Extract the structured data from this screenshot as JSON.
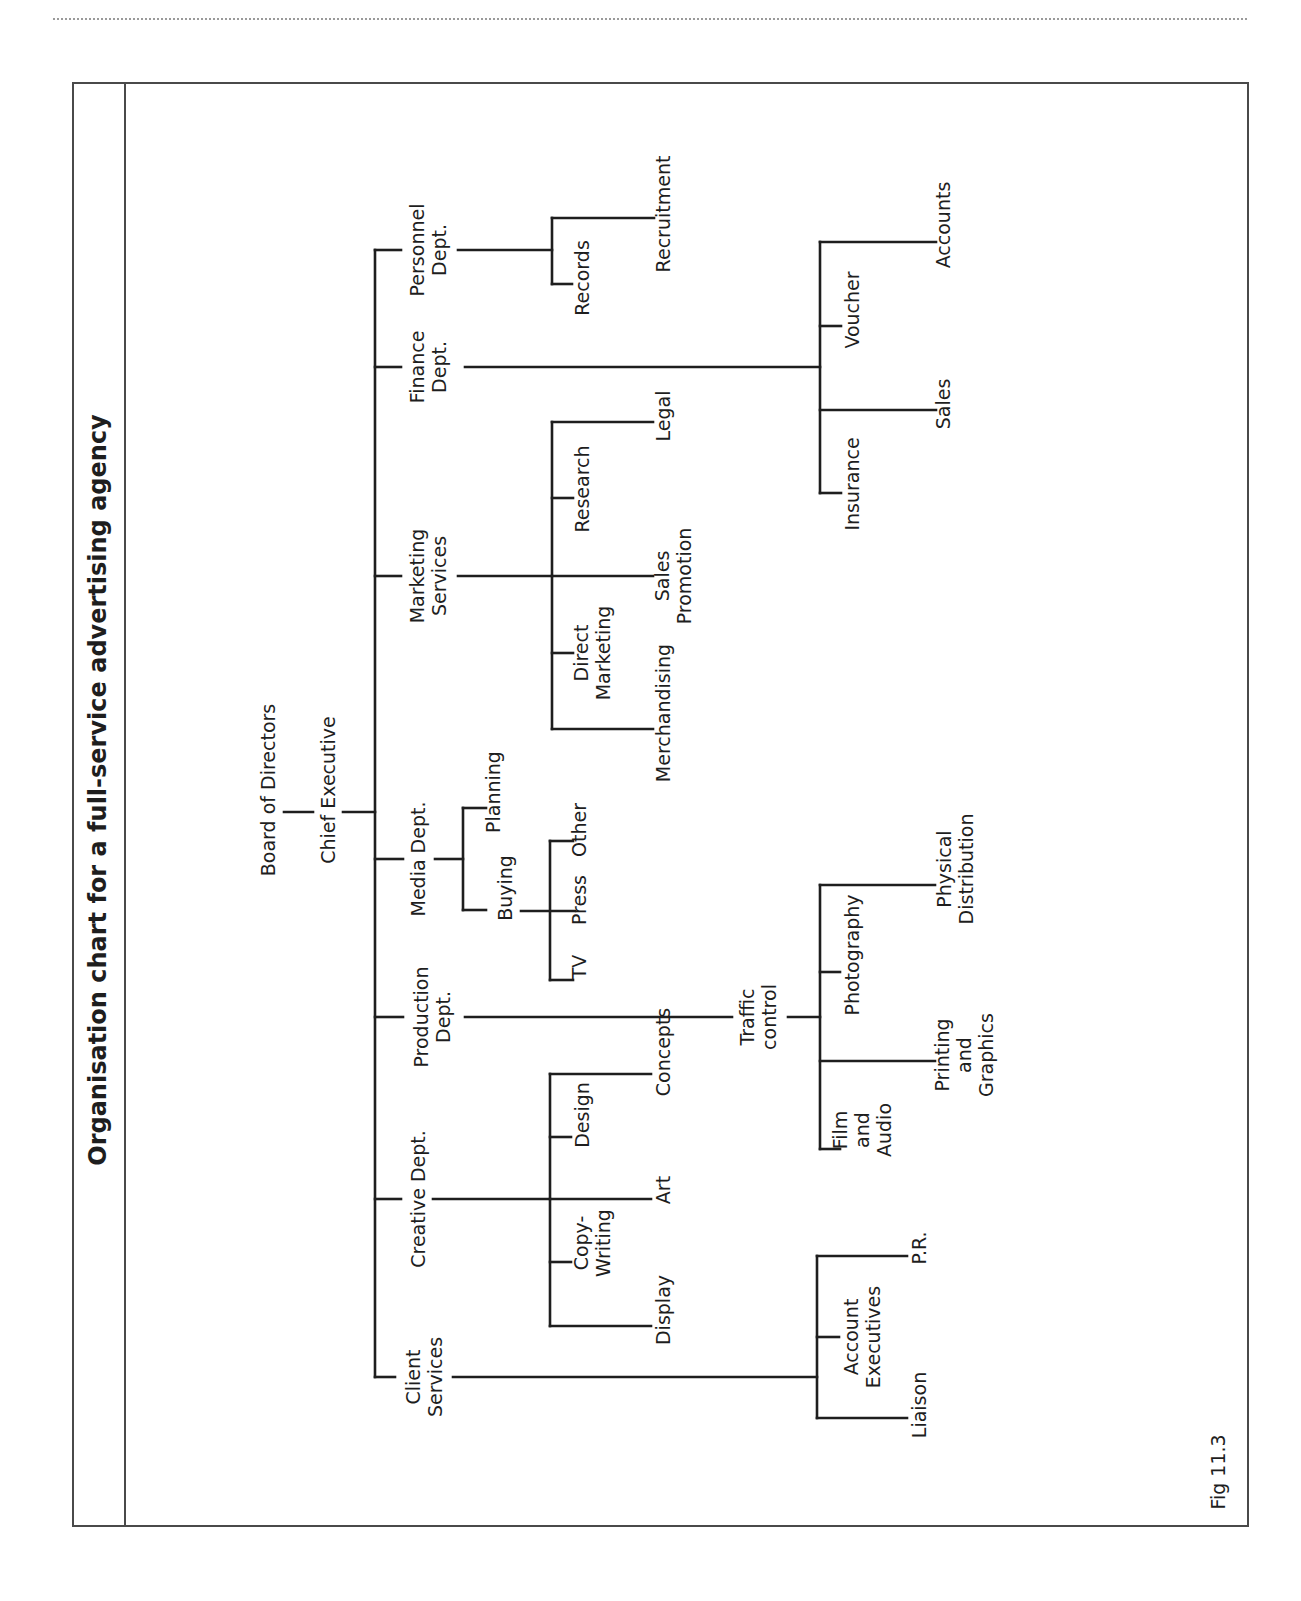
{
  "page": {
    "dotted_rule": true
  },
  "figure": {
    "title": "Organisation chart for a full-service advertising agency",
    "caption": "Fig 11.3"
  },
  "org_chart": {
    "root": "Board of Directors",
    "chief": "Chief Executive",
    "departments": [
      {
        "name": "Personnel Dept.",
        "lines": [
          "Personnel",
          "Dept."
        ],
        "children": [
          {
            "name": "Recruitment",
            "lines": [
              "Recruitment"
            ]
          },
          {
            "name": "Records",
            "lines": [
              "Records"
            ]
          }
        ]
      },
      {
        "name": "Finance Dept.",
        "lines": [
          "Finance",
          "Dept."
        ],
        "children": [
          {
            "name": "Accounts",
            "lines": [
              "Accounts"
            ]
          },
          {
            "name": "Voucher",
            "lines": [
              "Voucher"
            ]
          },
          {
            "name": "Sales",
            "lines": [
              "Sales"
            ]
          },
          {
            "name": "Insurance",
            "lines": [
              "Insurance"
            ]
          }
        ]
      },
      {
        "name": "Marketing Services",
        "lines": [
          "Marketing",
          "Services"
        ],
        "children": [
          {
            "name": "Legal",
            "lines": [
              "Legal"
            ]
          },
          {
            "name": "Research",
            "lines": [
              "Research"
            ]
          },
          {
            "name": "Sales Promotion",
            "lines": [
              "Sales",
              "Promotion"
            ]
          },
          {
            "name": "Direct Marketing",
            "lines": [
              "Direct",
              "Marketing"
            ]
          },
          {
            "name": "Merchandising",
            "lines": [
              "Merchandising"
            ]
          }
        ]
      },
      {
        "name": "Media Dept.",
        "lines": [
          "Media Dept."
        ],
        "children": [
          {
            "name": "Planning",
            "lines": [
              "Planning"
            ]
          },
          {
            "name": "Buying",
            "lines": [
              "Buying"
            ],
            "children": [
              {
                "name": "Other",
                "lines": [
                  "Other"
                ]
              },
              {
                "name": "Press",
                "lines": [
                  "Press"
                ]
              },
              {
                "name": "TV",
                "lines": [
                  "TV"
                ]
              }
            ]
          }
        ]
      },
      {
        "name": "Production Dept.",
        "lines": [
          "Production",
          "Dept."
        ],
        "children": [
          {
            "name": "Traffic control",
            "lines": [
              "Traffic",
              "control"
            ],
            "children": [
              {
                "name": "Physical Distribution",
                "lines": [
                  "Physical",
                  "Distribution"
                ]
              },
              {
                "name": "Photography",
                "lines": [
                  "Photography"
                ]
              },
              {
                "name": "Printing and Graphics",
                "lines": [
                  "Printing",
                  "and",
                  "Graphics"
                ]
              },
              {
                "name": "Film and Audio",
                "lines": [
                  "Film",
                  "and",
                  "Audio"
                ]
              }
            ]
          }
        ]
      },
      {
        "name": "Creative Dept.",
        "lines": [
          "Creative Dept."
        ],
        "children": [
          {
            "name": "Concepts",
            "lines": [
              "Concepts"
            ]
          },
          {
            "name": "Design",
            "lines": [
              "Design"
            ]
          },
          {
            "name": "Art",
            "lines": [
              "Art"
            ]
          },
          {
            "name": "Copy-Writing",
            "lines": [
              "Copy-",
              "Writing"
            ]
          },
          {
            "name": "Display",
            "lines": [
              "Display"
            ]
          }
        ]
      },
      {
        "name": "Client Services",
        "lines": [
          "Client",
          "Services"
        ],
        "children": [
          {
            "name": "P.R.",
            "lines": [
              "P.R."
            ]
          },
          {
            "name": "Account Executives",
            "lines": [
              "Account",
              "Executives"
            ]
          },
          {
            "name": "Liaison",
            "lines": [
              "Liaison"
            ]
          }
        ]
      }
    ]
  },
  "labels": {
    "board": [
      "Board of Directors"
    ],
    "chief": [
      "Chief Executive"
    ],
    "personnel": [
      "Personnel",
      "Dept."
    ],
    "recruitment": [
      "Recruitment"
    ],
    "records": [
      "Records"
    ],
    "finance": [
      "Finance",
      "Dept."
    ],
    "accounts": [
      "Accounts"
    ],
    "voucher": [
      "Voucher"
    ],
    "sales": [
      "Sales"
    ],
    "insurance": [
      "Insurance"
    ],
    "marketing": [
      "Marketing",
      "Services"
    ],
    "legal": [
      "Legal"
    ],
    "research": [
      "Research"
    ],
    "sales_promotion": [
      "Sales",
      "Promotion"
    ],
    "direct_marketing": [
      "Direct",
      "Marketing"
    ],
    "merchandising": [
      "Merchandising"
    ],
    "media": [
      "Media Dept."
    ],
    "planning": [
      "Planning"
    ],
    "buying": [
      "Buying"
    ],
    "other": [
      "Other"
    ],
    "press": [
      "Press"
    ],
    "tv": [
      "TV"
    ],
    "production": [
      "Production",
      "Dept."
    ],
    "traffic": [
      "Traffic",
      "control"
    ],
    "physical": [
      "Physical",
      "Distribution"
    ],
    "photography": [
      "Photography"
    ],
    "printing": [
      "Printing",
      "and",
      "Graphics"
    ],
    "film": [
      "Film",
      "and",
      "Audio"
    ],
    "creative": [
      "Creative Dept."
    ],
    "concepts": [
      "Concepts"
    ],
    "design": [
      "Design"
    ],
    "art": [
      "Art"
    ],
    "copywriting": [
      "Copy-",
      "Writing"
    ],
    "display": [
      "Display"
    ],
    "client": [
      "Client",
      "Services"
    ],
    "pr": [
      "P.R."
    ],
    "account_exec": [
      "Account",
      "Executives"
    ],
    "liaison": [
      "Liaison"
    ]
  },
  "colors": {
    "ink": "#1e1e1e",
    "frame": "#4a4a4a",
    "rule": "#9a9a9a",
    "background": "#ffffff"
  }
}
